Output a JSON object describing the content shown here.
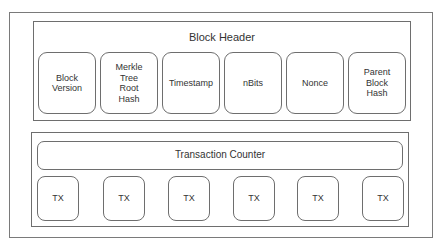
{
  "diagram": {
    "block_header": {
      "title": "Block Header",
      "fields": [
        {
          "label": "Block Version"
        },
        {
          "label": "Merkle Tree Root Hash"
        },
        {
          "label": "Timestamp"
        },
        {
          "label": "nBits"
        },
        {
          "label": "Nonce"
        },
        {
          "label": "Parent Block Hash"
        }
      ]
    },
    "transactions": {
      "counter_label": "Transaction Counter",
      "items": [
        {
          "label": "TX"
        },
        {
          "label": "TX"
        },
        {
          "label": "TX"
        },
        {
          "label": "TX"
        },
        {
          "label": "TX"
        },
        {
          "label": "TX"
        }
      ]
    },
    "colors": {
      "stroke": "#6e6e6e",
      "text": "#333333",
      "background": "#ffffff"
    }
  }
}
